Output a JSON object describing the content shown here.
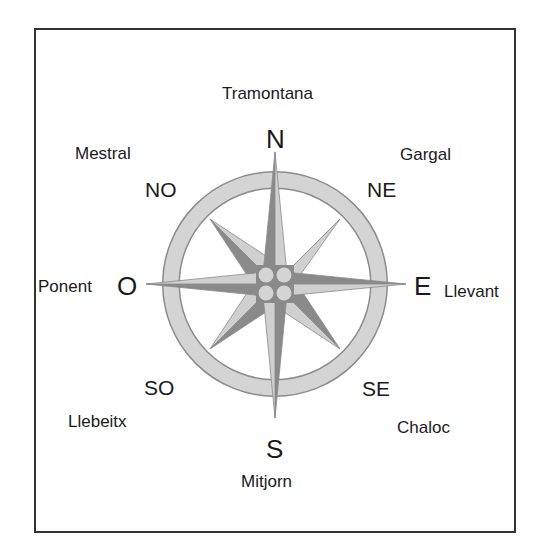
{
  "colors": {
    "ring_fill": "#d4d4d4",
    "ring_stroke": "#8c8c8c",
    "spike_dark": "#8a8a8a",
    "spike_light": "#d0d0d0",
    "hub_circle": "#d4d4d4",
    "frame_border": "#333333",
    "text": "#1a1a1a"
  },
  "compass": {
    "cardinals": {
      "north": "N",
      "east": "E",
      "south": "S",
      "west": "O"
    },
    "intercardinals": {
      "northeast": "NE",
      "southeast": "SE",
      "southwest": "SO",
      "northwest": "NO"
    },
    "winds": {
      "north": "Tramontana",
      "northeast": "Gargal",
      "east": "Llevant",
      "southeast": "Chaloc",
      "south": "Mitjorn",
      "southwest": "Llebeitx",
      "west": "Ponent",
      "northwest": "Mestral"
    }
  }
}
